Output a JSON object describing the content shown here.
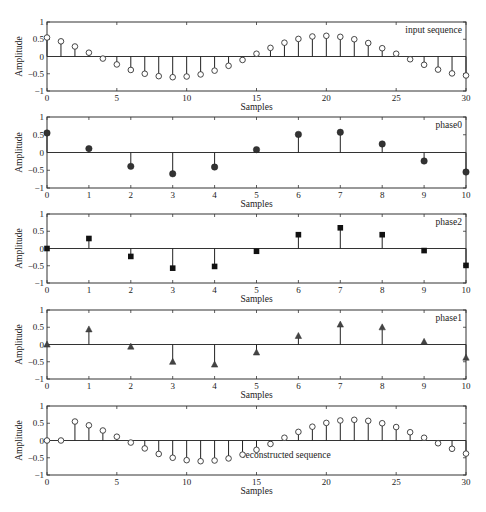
{
  "chart_data": [
    {
      "type": "stem",
      "id": "input",
      "legend": "input sequence",
      "legend_position": "top-right",
      "marker": "circle-open",
      "xlabel": "Samples",
      "ylabel": "Amplitude",
      "xlim": [
        0,
        30
      ],
      "ylim": [
        -1,
        1
      ],
      "xticks": [
        0,
        5,
        10,
        15,
        20,
        25,
        30
      ],
      "yticks": [
        -1,
        -0.5,
        0,
        0.5,
        1
      ],
      "ytick_labels": [
        "−1",
        "−0.5",
        "0",
        "0.5",
        "1"
      ],
      "x": [
        0,
        1,
        2,
        3,
        4,
        5,
        6,
        7,
        8,
        9,
        10,
        11,
        12,
        13,
        14,
        15,
        16,
        17,
        18,
        19,
        20,
        21,
        22,
        23,
        24,
        25,
        26,
        27,
        28,
        29,
        30
      ],
      "values": [
        0.55,
        0.44,
        0.29,
        0.11,
        -0.06,
        -0.23,
        -0.39,
        -0.5,
        -0.57,
        -0.6,
        -0.58,
        -0.52,
        -0.41,
        -0.27,
        -0.1,
        0.08,
        0.25,
        0.4,
        0.51,
        0.58,
        0.6,
        0.57,
        0.5,
        0.39,
        0.24,
        0.08,
        -0.08,
        -0.24,
        -0.38,
        -0.49,
        -0.55
      ]
    },
    {
      "type": "stem",
      "id": "phase0",
      "legend": "phase0",
      "legend_position": "top-right",
      "marker": "circle-filled",
      "xlabel": "Samples",
      "ylabel": "Amplitude",
      "xlim": [
        0,
        10
      ],
      "ylim": [
        -1,
        1
      ],
      "xticks": [
        0,
        1,
        2,
        3,
        4,
        5,
        6,
        7,
        8,
        9,
        10
      ],
      "yticks": [
        -1,
        -0.5,
        0,
        0.5,
        1
      ],
      "ytick_labels": [
        "−1",
        "−0.5",
        "0",
        "0.5",
        "1"
      ],
      "x": [
        0,
        1,
        2,
        3,
        4,
        5,
        6,
        7,
        8,
        9,
        10
      ],
      "values": [
        0.55,
        0.11,
        -0.39,
        -0.6,
        -0.41,
        0.08,
        0.51,
        0.57,
        0.24,
        -0.24,
        -0.55
      ]
    },
    {
      "type": "stem",
      "id": "phase2",
      "legend": "phase2",
      "legend_position": "top-right",
      "marker": "square-filled",
      "xlabel": "Samples",
      "ylabel": "Amplitude",
      "xlim": [
        0,
        10
      ],
      "ylim": [
        -1,
        1
      ],
      "xticks": [
        0,
        1,
        2,
        3,
        4,
        5,
        6,
        7,
        8,
        9,
        10
      ],
      "yticks": [
        -1,
        -0.5,
        0,
        0.5,
        1
      ],
      "ytick_labels": [
        "−1",
        "−0.5",
        "0",
        "0.5",
        "1"
      ],
      "x": [
        0,
        1,
        2,
        3,
        4,
        5,
        6,
        7,
        8,
        9,
        10
      ],
      "values": [
        0.0,
        0.29,
        -0.23,
        -0.57,
        -0.52,
        -0.08,
        0.4,
        0.6,
        0.4,
        -0.06,
        -0.49
      ]
    },
    {
      "type": "stem",
      "id": "phase1",
      "legend": "phase1",
      "legend_position": "top-right",
      "marker": "triangle-filled",
      "xlabel": "Samples",
      "ylabel": "Amplitude",
      "xlim": [
        0,
        10
      ],
      "ylim": [
        -1,
        1
      ],
      "xticks": [
        0,
        1,
        2,
        3,
        4,
        5,
        6,
        7,
        8,
        9,
        10
      ],
      "yticks": [
        -1,
        -0.5,
        0,
        0.5,
        1
      ],
      "ytick_labels": [
        "−1",
        "−0.5",
        "0",
        "0.5",
        "1"
      ],
      "x": [
        0,
        1,
        2,
        3,
        4,
        5,
        6,
        7,
        8,
        9,
        10
      ],
      "values": [
        0.0,
        0.44,
        -0.06,
        -0.5,
        -0.58,
        -0.23,
        0.25,
        0.58,
        0.5,
        0.08,
        -0.38
      ]
    },
    {
      "type": "stem",
      "id": "reconstructed",
      "legend": "reconstructed sequence",
      "legend_position": "bottom-center",
      "marker": "circle-open",
      "xlabel": "Samples",
      "ylabel": "Amplitude",
      "xlim": [
        0,
        30
      ],
      "ylim": [
        -1,
        1
      ],
      "xticks": [
        0,
        5,
        10,
        15,
        20,
        25,
        30
      ],
      "yticks": [
        -1,
        -0.5,
        0,
        0.5,
        1
      ],
      "ytick_labels": [
        "−1",
        "−0.5",
        "0",
        "0.5",
        "1"
      ],
      "x": [
        0,
        1,
        2,
        3,
        4,
        5,
        6,
        7,
        8,
        9,
        10,
        11,
        12,
        13,
        14,
        15,
        16,
        17,
        18,
        19,
        20,
        21,
        22,
        23,
        24,
        25,
        26,
        27,
        28,
        29,
        30
      ],
      "values": [
        0.0,
        0.0,
        0.55,
        0.44,
        0.29,
        0.11,
        -0.06,
        -0.23,
        -0.39,
        -0.5,
        -0.57,
        -0.6,
        -0.58,
        -0.52,
        -0.41,
        -0.27,
        -0.1,
        0.08,
        0.25,
        0.4,
        0.51,
        0.58,
        0.6,
        0.57,
        0.5,
        0.39,
        0.24,
        0.08,
        -0.08,
        -0.24,
        -0.38
      ]
    }
  ]
}
